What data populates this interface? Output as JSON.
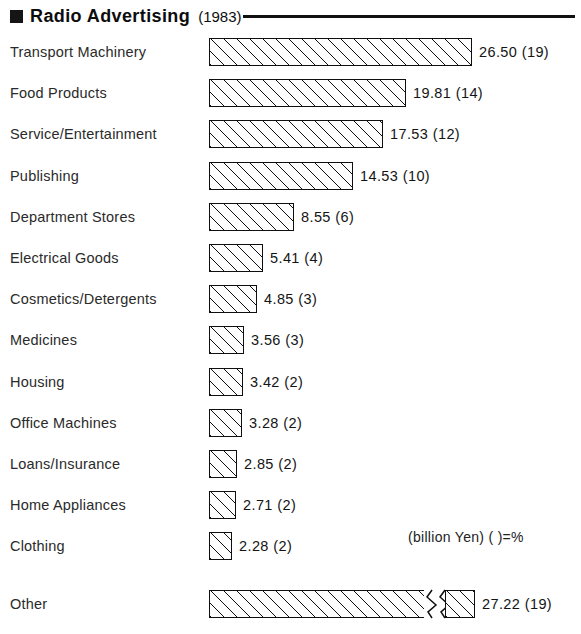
{
  "header": {
    "marker": "filled-square-bullet",
    "title": "Radio Advertising",
    "year": "(1983)"
  },
  "units_note": "(billion Yen) ( )=%",
  "chart_data": {
    "type": "bar",
    "orientation": "horizontal",
    "title": "Radio Advertising",
    "subtitle": "(1983)",
    "xlabel": "",
    "ylabel": "",
    "units": "billion Yen",
    "paren_note": "( )=%",
    "grid": false,
    "legend_position": "none",
    "axis_break": {
      "series_index": 13,
      "category": "Other",
      "note": "bar is drawn broken (zig-zag) because the value exceeds the plot scale"
    },
    "categories": [
      "Transport Machinery",
      "Food Products",
      "Service/Entertainment",
      "Publishing",
      "Department Stores",
      "Electrical Goods",
      "Cosmetics/Detergents",
      "Medicines",
      "Housing",
      "Office Machines",
      "Loans/Insurance",
      "Home Appliances",
      "Clothing",
      "Other"
    ],
    "values": [
      26.5,
      19.81,
      17.53,
      14.53,
      8.55,
      5.41,
      4.85,
      3.56,
      3.42,
      3.28,
      2.85,
      2.71,
      2.28,
      27.22
    ],
    "percentages": [
      19,
      14,
      12,
      10,
      6,
      4,
      3,
      3,
      2,
      2,
      2,
      2,
      2,
      19
    ],
    "value_labels": [
      "26.50 (19)",
      "19.81 (14)",
      "17.53 (12)",
      "14.53 (10)",
      "8.55 (6)",
      "5.41 (4)",
      "4.85 (3)",
      "3.56 (3)",
      "3.42 (2)",
      "3.28 (2)",
      "2.85 (2)",
      "2.71 (2)",
      "2.28 (2)",
      "27.22 (19)"
    ],
    "xlim": [
      0,
      28
    ]
  }
}
